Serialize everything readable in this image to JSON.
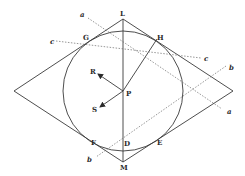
{
  "figure": {
    "rhombus": {
      "top": [
        123,
        19
      ],
      "right": [
        233,
        91
      ],
      "bottom": [
        123,
        162
      ],
      "left": [
        14,
        91
      ]
    },
    "circle": {
      "center": [
        123,
        91
      ],
      "radius": 60
    },
    "points": {
      "L": {
        "label": "L",
        "pos": [
          123,
          19
        ],
        "label_pos": [
          120,
          16
        ]
      },
      "M": {
        "label": "M",
        "pos": [
          123,
          162
        ],
        "label_pos": [
          120,
          170
        ]
      },
      "G": {
        "label": "G",
        "pos": [
          84,
          43
        ],
        "label_pos": [
          83,
          40
        ]
      },
      "H": {
        "label": "H",
        "pos": [
          157,
          39
        ],
        "label_pos": [
          157,
          40
        ]
      },
      "F": {
        "label": "F",
        "pos": [
          93,
          140
        ],
        "label_pos": [
          91,
          145
        ]
      },
      "E": {
        "label": "E",
        "pos": [
          157,
          140
        ],
        "label_pos": [
          157,
          145
        ]
      },
      "D": {
        "label": "D",
        "pos": [
          126,
          148
        ],
        "label_pos": [
          124,
          146
        ]
      },
      "P": {
        "label": "P",
        "pos": [
          123,
          91
        ],
        "label_pos": [
          126,
          96
        ]
      },
      "R": {
        "label": "R",
        "pos": [
          97,
          73
        ],
        "label_pos": [
          90,
          74
        ]
      },
      "S": {
        "label": "S",
        "pos": [
          99,
          108
        ],
        "label_pos": [
          92,
          112
        ]
      }
    },
    "dotted_lines": {
      "a": {
        "label_start": "a",
        "label_end": "a",
        "from": [
          88,
          18
        ],
        "to": [
          222,
          109
        ],
        "label_start_pos": [
          80,
          17
        ],
        "label_end_pos": [
          227,
          114
        ]
      },
      "b": {
        "label_start": "b",
        "label_end": "b",
        "from": [
          226,
          66
        ],
        "to": [
          96,
          157
        ],
        "label_start_pos": [
          229,
          70
        ],
        "label_end_pos": [
          87,
          162
        ]
      },
      "c": {
        "label_start": "c",
        "label_end": "c",
        "from": [
          56,
          41
        ],
        "to": [
          201,
          58
        ],
        "label_start_pos": [
          50,
          44
        ],
        "label_end_pos": [
          204,
          61
        ]
      }
    },
    "solid_lines": {
      "LM": {
        "from": [
          123,
          19
        ],
        "to": [
          123,
          162
        ]
      },
      "PH": {
        "from": [
          123,
          91
        ],
        "to": [
          157,
          39
        ]
      }
    },
    "arrows": {
      "PR": {
        "from": [
          123,
          91
        ],
        "to": [
          98,
          74
        ]
      },
      "PS": {
        "from": [
          123,
          91
        ],
        "to": [
          100,
          107
        ]
      }
    }
  }
}
